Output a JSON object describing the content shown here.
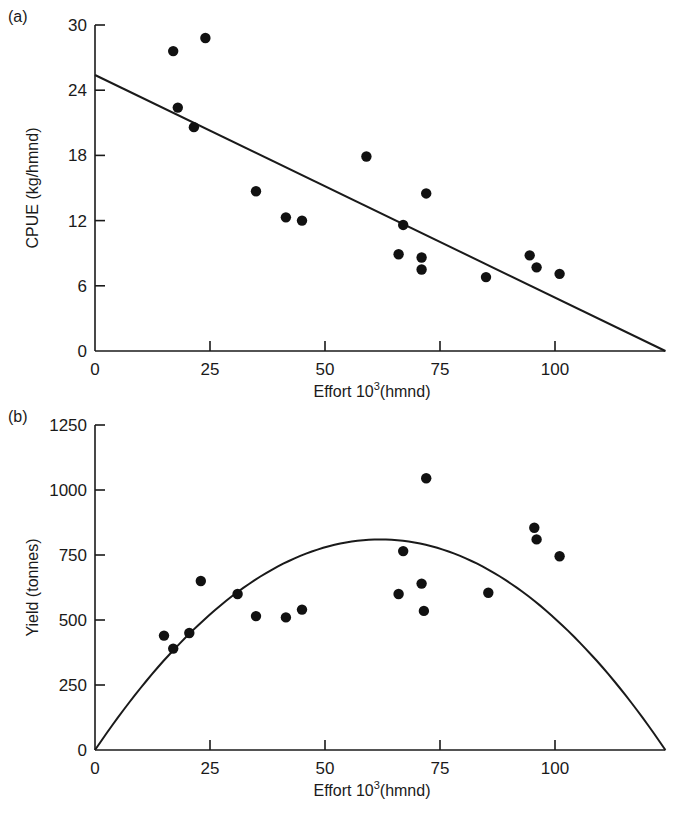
{
  "chart_data": [
    {
      "type": "scatter",
      "panel_label": "(a)",
      "title": "",
      "xlabel": "Effort 10",
      "xlabel_sup": "3",
      "xlabel_suffix": "(hmnd)",
      "ylabel": "CPUE (kg/hmnd)",
      "xlim": [
        0,
        125
      ],
      "ylim": [
        0,
        30
      ],
      "xticks": [
        0,
        25,
        50,
        75,
        100
      ],
      "yticks": [
        0,
        6,
        12,
        18,
        24,
        30
      ],
      "grid": false,
      "points": [
        {
          "x": 17,
          "y": 27.6
        },
        {
          "x": 24,
          "y": 28.8
        },
        {
          "x": 18,
          "y": 22.4
        },
        {
          "x": 21.5,
          "y": 20.6
        },
        {
          "x": 35,
          "y": 14.7
        },
        {
          "x": 41.5,
          "y": 12.3
        },
        {
          "x": 45,
          "y": 12.0
        },
        {
          "x": 59,
          "y": 17.9
        },
        {
          "x": 72,
          "y": 14.5
        },
        {
          "x": 67,
          "y": 11.6
        },
        {
          "x": 66,
          "y": 8.9
        },
        {
          "x": 71,
          "y": 8.6
        },
        {
          "x": 71,
          "y": 7.5
        },
        {
          "x": 85,
          "y": 6.8
        },
        {
          "x": 94.5,
          "y": 8.8
        },
        {
          "x": 96,
          "y": 7.7
        },
        {
          "x": 101,
          "y": 7.1
        }
      ],
      "fit": {
        "type": "linear",
        "intercept": 25.4,
        "x_intercept": 124
      }
    },
    {
      "type": "scatter",
      "panel_label": "(b)",
      "title": "",
      "xlabel": "Effort 10",
      "xlabel_sup": "3",
      "xlabel_suffix": "(hmnd)",
      "ylabel": "Yield (tonnes)",
      "xlim": [
        0,
        125
      ],
      "ylim": [
        0,
        1250
      ],
      "xticks": [
        0,
        25,
        50,
        75,
        100
      ],
      "yticks": [
        0,
        250,
        500,
        750,
        1000,
        1250
      ],
      "grid": false,
      "points": [
        {
          "x": 15,
          "y": 440
        },
        {
          "x": 17,
          "y": 390
        },
        {
          "x": 20.5,
          "y": 450
        },
        {
          "x": 23,
          "y": 650
        },
        {
          "x": 31,
          "y": 600
        },
        {
          "x": 35,
          "y": 515
        },
        {
          "x": 41.5,
          "y": 510
        },
        {
          "x": 45,
          "y": 540
        },
        {
          "x": 72,
          "y": 1045
        },
        {
          "x": 67,
          "y": 765
        },
        {
          "x": 66,
          "y": 600
        },
        {
          "x": 71,
          "y": 640
        },
        {
          "x": 71.5,
          "y": 535
        },
        {
          "x": 85.5,
          "y": 605
        },
        {
          "x": 95.5,
          "y": 855
        },
        {
          "x": 96,
          "y": 810
        },
        {
          "x": 101,
          "y": 745
        }
      ],
      "fit": {
        "type": "parabola",
        "peak_x": 63,
        "peak_y": 810,
        "x_intercept": 124
      }
    }
  ]
}
